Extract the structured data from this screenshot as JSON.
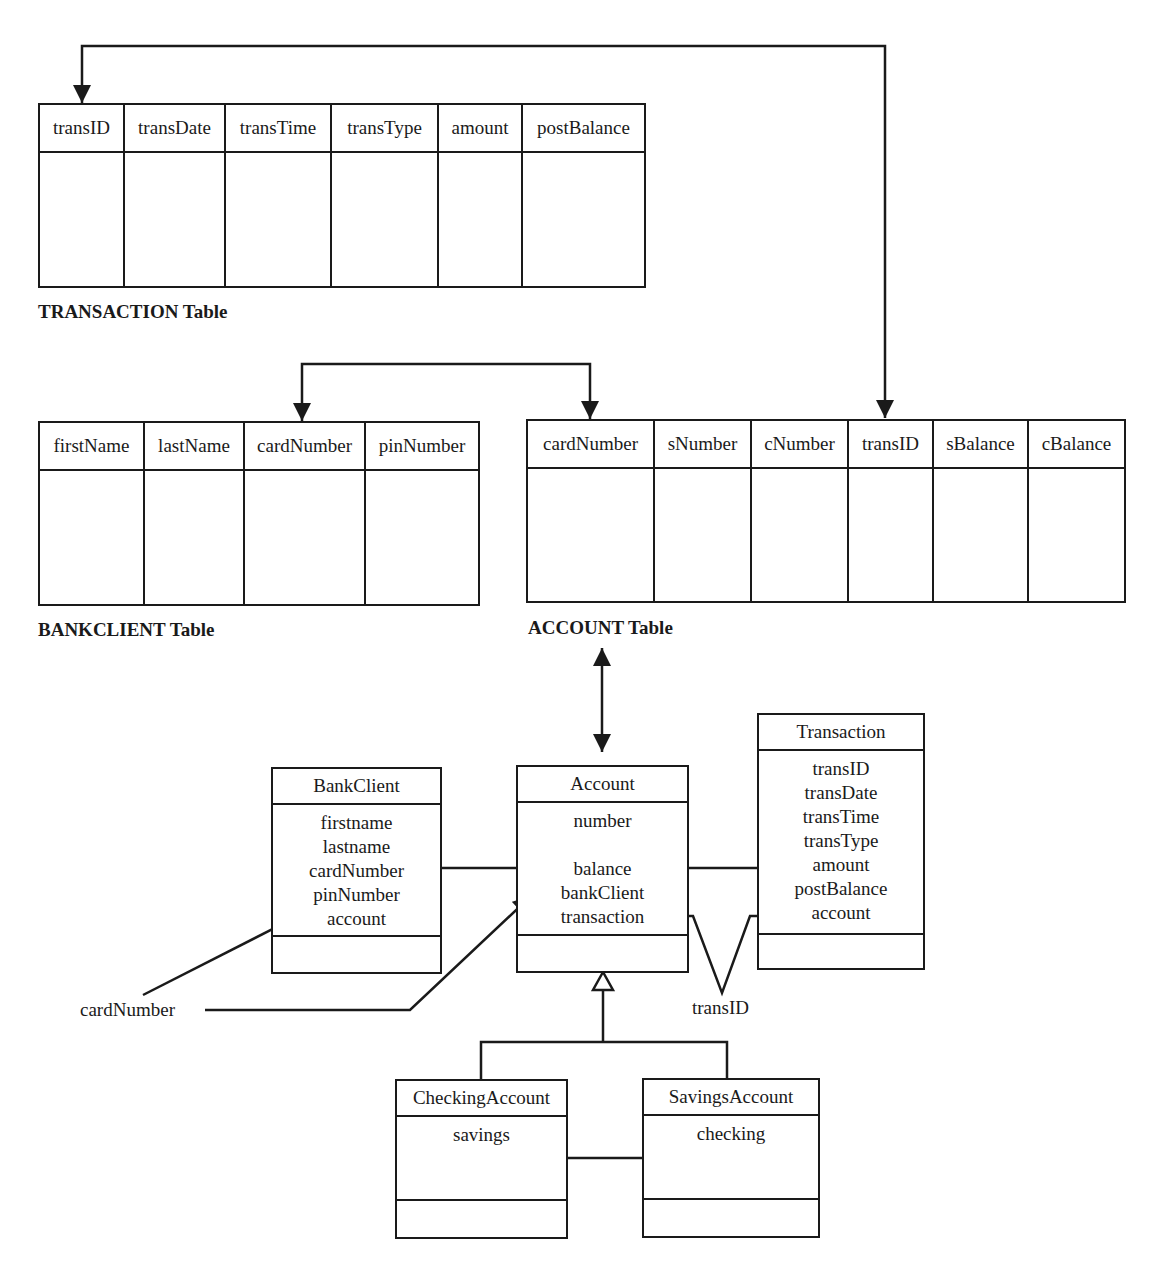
{
  "tables": {
    "transaction": {
      "caption": "TRANSACTION Table",
      "columns": [
        "transID",
        "transDate",
        "transTime",
        "transType",
        "amount",
        "postBalance"
      ]
    },
    "bankclient": {
      "caption": "BANKCLIENT Table",
      "columns": [
        "firstName",
        "lastName",
        "cardNumber",
        "pinNumber"
      ]
    },
    "account": {
      "caption": "ACCOUNT Table",
      "columns": [
        "cardNumber",
        "sNumber",
        "cNumber",
        "transID",
        "sBalance",
        "cBalance"
      ]
    }
  },
  "classes": {
    "bankclient": {
      "name": "BankClient",
      "attributes": [
        "firstname",
        "lastname",
        "cardNumber",
        "pinNumber",
        "account"
      ]
    },
    "account": {
      "name": "Account",
      "attributes": [
        "number",
        "",
        "balance",
        "bankClient",
        "transaction"
      ]
    },
    "transaction": {
      "name": "Transaction",
      "attributes": [
        "transID",
        "transDate",
        "transTime",
        "transType",
        "amount",
        "postBalance",
        "account"
      ]
    },
    "checking": {
      "name": "CheckingAccount",
      "attributes": [
        "savings"
      ]
    },
    "savings": {
      "name": "SavingsAccount",
      "attributes": [
        "checking"
      ]
    }
  },
  "annotations": {
    "card_number_label": "cardNumber",
    "trans_id_label": "transID"
  },
  "colors": {
    "line": "#1a1a1a",
    "background": "#ffffff"
  }
}
